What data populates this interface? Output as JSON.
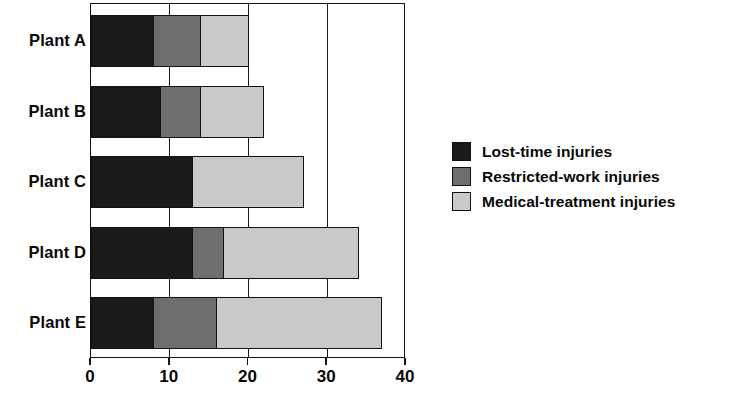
{
  "chart_data": {
    "type": "bar",
    "orientation": "horizontal",
    "stacked": true,
    "title": "",
    "xlabel": "",
    "ylabel": "",
    "categories": [
      "Plant A",
      "Plant B",
      "Plant C",
      "Plant D",
      "Plant E"
    ],
    "series": [
      {
        "name": "Lost-time injuries",
        "color": "#1b1b1b",
        "values": [
          8,
          9,
          13,
          13,
          8
        ]
      },
      {
        "name": "Restricted-work injuries",
        "color": "#6f6f6f",
        "values": [
          6,
          5,
          0,
          4,
          8
        ]
      },
      {
        "name": "Medical-treatment injuries",
        "color": "#c9c9c9",
        "values": [
          6,
          8,
          14,
          17,
          21
        ]
      }
    ],
    "totals": [
      20,
      22,
      27,
      34,
      37
    ],
    "xlim": [
      0,
      40
    ],
    "xticks": [
      0,
      10,
      20,
      30,
      40
    ],
    "xtick_labels": [
      "0",
      "10",
      "20",
      "30",
      "40"
    ],
    "grid": true,
    "grid_axis": "x",
    "legend_position": "right"
  },
  "legend": {
    "items": [
      {
        "label": "Lost-time injuries",
        "swatch": "legend-swatch-lost-time"
      },
      {
        "label": "Restricted-work injuries",
        "swatch": "legend-swatch-restricted-work"
      },
      {
        "label": "Medical-treatment injuries",
        "swatch": "legend-swatch-medical-treatment"
      }
    ]
  },
  "colors": {
    "lost_time": "#1b1b1b",
    "restricted_work": "#6f6f6f",
    "medical_treatment": "#c9c9c9",
    "axis": "#121212",
    "background": "#ffffff"
  }
}
